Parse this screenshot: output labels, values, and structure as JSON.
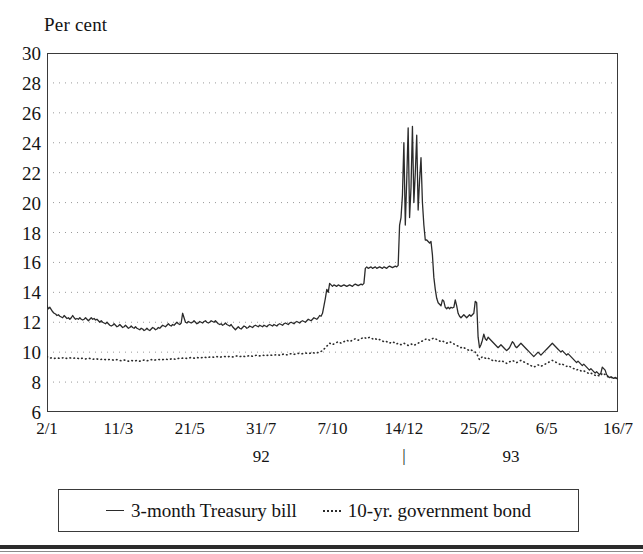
{
  "chart_data": {
    "type": "line",
    "title": "",
    "ylabel": "Per cent",
    "xlabel": "",
    "ylim": [
      6,
      30
    ],
    "ytick_values": [
      30,
      28,
      26,
      24,
      22,
      20,
      18,
      16,
      14,
      12,
      10,
      8,
      6
    ],
    "ytick_labels": [
      "30",
      "28",
      "26",
      "24",
      "22",
      "20",
      "18",
      "16",
      "14",
      "12",
      "10",
      "8",
      "6"
    ],
    "grid": true,
    "grid_style": "dotted-horizontal",
    "legend_position": "below-plot",
    "x_index_range": [
      0,
      400
    ],
    "xtick_positions": [
      0,
      50,
      100,
      150,
      200,
      250,
      300,
      350,
      400
    ],
    "xtick_labels": [
      "2/1",
      "11/3",
      "21/5",
      "31/7",
      "7/10",
      "14/12",
      "25/2",
      "6/5",
      "16/7"
    ],
    "year_labels": [
      {
        "label": "92",
        "x_index": 150
      },
      {
        "label": "93",
        "x_index": 325
      }
    ],
    "year_separator": {
      "label": "|",
      "x_index": 250
    },
    "series": [
      {
        "name": "3-month Treasury bill",
        "style": "solid",
        "color": "#2b2b2b",
        "values": [
          13.1,
          12.9,
          13.0,
          12.85,
          12.7,
          12.6,
          12.55,
          12.45,
          12.5,
          12.4,
          12.35,
          12.3,
          12.45,
          12.35,
          12.25,
          12.3,
          12.2,
          12.3,
          12.45,
          12.3,
          12.2,
          12.25,
          12.2,
          12.3,
          12.2,
          12.15,
          12.2,
          12.3,
          12.2,
          12.1,
          12.2,
          12.3,
          12.2,
          12.25,
          12.15,
          12.2,
          12.1,
          12.0,
          12.1,
          12.0,
          11.95,
          11.9,
          12.0,
          11.9,
          11.8,
          11.75,
          11.8,
          11.9,
          11.8,
          11.7,
          11.75,
          11.85,
          11.75,
          11.65,
          11.7,
          11.8,
          11.7,
          11.6,
          11.65,
          11.75,
          11.65,
          11.6,
          11.7,
          11.6,
          11.55,
          11.5,
          11.6,
          11.55,
          11.45,
          11.5,
          11.6,
          11.5,
          11.45,
          11.55,
          11.65,
          11.6,
          11.5,
          11.55,
          11.65,
          11.6,
          11.7,
          11.8,
          11.75,
          11.7,
          11.8,
          11.9,
          11.8,
          11.75,
          11.85,
          11.8,
          11.9,
          12.0,
          11.9,
          11.85,
          11.95,
          12.6,
          12.3,
          12.0,
          11.95,
          12.05,
          12.0,
          11.95,
          12.0,
          12.1,
          12.0,
          11.9,
          11.95,
          12.05,
          12.0,
          11.95,
          12.05,
          12.1,
          12.0,
          11.95,
          12.0,
          12.1,
          12.05,
          12.0,
          12.1,
          12.0,
          11.9,
          11.85,
          11.9,
          11.8,
          11.85,
          11.95,
          11.85,
          11.8,
          11.75,
          11.85,
          11.7,
          11.6,
          11.5,
          11.6,
          11.7,
          11.6,
          11.55,
          11.65,
          11.75,
          11.7,
          11.6,
          11.65,
          11.75,
          11.7,
          11.65,
          11.75,
          11.8,
          11.75,
          11.7,
          11.8,
          11.75,
          11.7,
          11.8,
          11.75,
          11.7,
          11.8,
          11.85,
          11.8,
          11.75,
          11.85,
          11.8,
          11.75,
          11.85,
          11.9,
          11.85,
          11.8,
          11.9,
          11.95,
          11.9,
          11.85,
          11.95,
          12.0,
          11.95,
          11.9,
          12.0,
          12.05,
          12.0,
          11.95,
          12.05,
          12.1,
          12.05,
          12.0,
          12.1,
          12.2,
          12.15,
          12.1,
          12.2,
          12.3,
          12.25,
          12.2,
          12.3,
          12.45,
          12.4,
          12.6,
          13.1,
          13.6,
          14.2,
          14.0,
          14.6,
          14.5,
          14.4,
          14.5,
          14.45,
          14.4,
          14.5,
          14.45,
          14.4,
          14.45,
          14.5,
          14.45,
          14.4,
          14.45,
          14.5,
          14.45,
          14.4,
          14.5,
          14.55,
          14.5,
          14.45,
          14.5,
          14.55,
          14.5,
          14.6,
          15.6,
          15.7,
          15.6,
          15.65,
          15.7,
          15.6,
          15.65,
          15.7,
          15.6,
          15.65,
          15.7,
          15.65,
          15.6,
          15.7,
          15.65,
          15.6,
          15.7,
          15.75,
          15.7,
          15.65,
          15.7,
          15.75,
          15.7,
          15.8,
          18.5,
          19.0,
          20.5,
          24.0,
          18.5,
          21.5,
          25.0,
          19.0,
          21.0,
          25.1,
          20.0,
          22.0,
          24.5,
          19.5,
          21.5,
          23.0,
          20.0,
          18.5,
          17.5,
          17.5,
          17.4,
          17.3,
          17.4,
          16.5,
          15.0,
          14.2,
          13.6,
          13.3,
          13.2,
          13.1,
          13.5,
          13.4,
          13.0,
          12.9,
          13.0,
          12.9,
          13.0,
          12.95,
          13.0,
          13.5,
          13.1,
          12.6,
          12.4,
          12.3,
          12.4,
          12.5,
          12.4,
          12.3,
          12.4,
          12.5,
          12.4,
          12.5,
          12.6,
          13.4,
          13.3,
          11.0,
          10.3,
          10.5,
          10.8,
          11.2,
          10.9,
          10.8,
          11.0,
          10.9,
          10.8,
          10.7,
          10.6,
          10.5,
          10.4,
          10.3,
          10.4,
          10.5,
          10.4,
          10.3,
          10.2,
          10.1,
          10.2,
          10.3,
          10.5,
          10.7,
          10.6,
          10.4,
          10.3,
          10.4,
          10.5,
          10.6,
          10.5,
          10.4,
          10.3,
          10.2,
          10.1,
          10.0,
          9.9,
          9.8,
          9.7,
          9.8,
          9.9,
          10.0,
          9.9,
          9.8,
          9.9,
          10.0,
          10.1,
          10.2,
          10.3,
          10.4,
          10.5,
          10.6,
          10.5,
          10.4,
          10.3,
          10.2,
          10.1,
          10.0,
          10.1,
          10.0,
          9.9,
          9.8,
          9.9,
          9.8,
          9.7,
          9.6,
          9.5,
          9.4,
          9.3,
          9.4,
          9.3,
          9.2,
          9.1,
          9.2,
          9.1,
          9.0,
          8.9,
          8.8,
          8.9,
          8.8,
          8.7,
          8.6,
          8.7,
          8.6,
          8.5,
          8.6,
          9.0,
          8.9,
          8.8,
          8.5,
          8.4,
          8.3,
          8.35,
          8.3,
          8.25,
          8.3,
          8.25,
          8.2
        ]
      },
      {
        "name": "10-yr. government bond",
        "style": "dotted",
        "color": "#2b2b2b",
        "values": [
          9.7,
          9.65,
          9.6,
          9.62,
          9.6,
          9.58,
          9.6,
          9.62,
          9.6,
          9.58,
          9.6,
          9.62,
          9.65,
          9.6,
          9.58,
          9.6,
          9.62,
          9.6,
          9.58,
          9.6,
          9.62,
          9.6,
          9.58,
          9.55,
          9.58,
          9.6,
          9.58,
          9.55,
          9.58,
          9.6,
          9.58,
          9.55,
          9.52,
          9.55,
          9.58,
          9.55,
          9.52,
          9.5,
          9.52,
          9.55,
          9.52,
          9.5,
          9.48,
          9.5,
          9.52,
          9.5,
          9.48,
          9.45,
          9.48,
          9.5,
          9.48,
          9.45,
          9.42,
          9.45,
          9.48,
          9.45,
          9.42,
          9.4,
          9.42,
          9.45,
          9.42,
          9.4,
          9.42,
          9.45,
          9.42,
          9.4,
          9.42,
          9.45,
          9.48,
          9.45,
          9.42,
          9.45,
          9.48,
          9.5,
          9.48,
          9.45,
          9.48,
          9.5,
          9.52,
          9.5,
          9.48,
          9.5,
          9.52,
          9.55,
          9.52,
          9.5,
          9.52,
          9.55,
          9.58,
          9.55,
          9.52,
          9.55,
          9.58,
          9.6,
          9.58,
          9.6,
          9.62,
          9.6,
          9.58,
          9.6,
          9.62,
          9.65,
          9.62,
          9.6,
          9.62,
          9.65,
          9.62,
          9.6,
          9.62,
          9.65,
          9.68,
          9.65,
          9.62,
          9.65,
          9.68,
          9.7,
          9.68,
          9.65,
          9.68,
          9.7,
          9.68,
          9.65,
          9.68,
          9.7,
          9.72,
          9.7,
          9.68,
          9.7,
          9.72,
          9.7,
          9.68,
          9.7,
          9.72,
          9.75,
          9.72,
          9.7,
          9.72,
          9.75,
          9.72,
          9.7,
          9.72,
          9.75,
          9.78,
          9.75,
          9.72,
          9.75,
          9.78,
          9.8,
          9.78,
          9.75,
          9.78,
          9.8,
          9.78,
          9.75,
          9.78,
          9.8,
          9.82,
          9.8,
          9.78,
          9.8,
          9.82,
          9.85,
          9.82,
          9.8,
          9.82,
          9.85,
          9.88,
          9.85,
          9.82,
          9.85,
          9.88,
          9.9,
          9.88,
          9.85,
          9.88,
          9.9,
          9.92,
          9.9,
          9.88,
          9.9,
          9.92,
          9.95,
          9.92,
          9.9,
          9.92,
          9.95,
          9.98,
          9.95,
          9.92,
          9.95,
          9.98,
          10.0,
          10.05,
          10.1,
          10.2,
          10.3,
          10.4,
          10.5,
          10.6,
          10.55,
          10.5,
          10.55,
          10.6,
          10.65,
          10.7,
          10.65,
          10.6,
          10.65,
          10.7,
          10.75,
          10.8,
          10.75,
          10.7,
          10.75,
          10.8,
          10.85,
          10.9,
          10.85,
          10.8,
          10.85,
          10.9,
          10.95,
          11.0,
          10.95,
          10.9,
          10.95,
          11.0,
          10.95,
          10.9,
          10.85,
          10.9,
          10.85,
          10.8,
          10.85,
          10.8,
          10.75,
          10.7,
          10.75,
          10.7,
          10.65,
          10.6,
          10.65,
          10.7,
          10.65,
          10.6,
          10.55,
          10.6,
          10.55,
          10.5,
          10.55,
          10.6,
          10.55,
          10.5,
          10.45,
          10.5,
          10.55,
          10.5,
          10.45,
          10.5,
          10.55,
          10.6,
          10.65,
          10.7,
          10.75,
          10.8,
          10.85,
          10.9,
          10.85,
          10.8,
          10.85,
          10.9,
          10.95,
          10.9,
          10.85,
          10.8,
          10.75,
          10.7,
          10.75,
          10.7,
          10.65,
          10.6,
          10.65,
          10.7,
          10.65,
          10.6,
          10.55,
          10.5,
          10.45,
          10.4,
          10.35,
          10.3,
          10.35,
          10.3,
          10.25,
          10.2,
          10.15,
          10.1,
          10.15,
          10.1,
          10.05,
          10.0,
          9.9,
          9.7,
          9.5,
          9.6,
          9.7,
          9.65,
          9.6,
          9.55,
          9.6,
          9.55,
          9.5,
          9.45,
          9.4,
          9.45,
          9.4,
          9.35,
          9.4,
          9.45,
          9.4,
          9.35,
          9.3,
          9.25,
          9.3,
          9.35,
          9.4,
          9.45,
          9.4,
          9.35,
          9.3,
          9.35,
          9.4,
          9.45,
          9.4,
          9.35,
          9.3,
          9.25,
          9.2,
          9.15,
          9.1,
          9.05,
          9.0,
          9.05,
          9.1,
          9.15,
          9.1,
          9.05,
          9.1,
          9.15,
          9.2,
          9.25,
          9.3,
          9.35,
          9.4,
          9.45,
          9.4,
          9.35,
          9.3,
          9.25,
          9.2,
          9.15,
          9.2,
          9.15,
          9.1,
          9.05,
          9.1,
          9.05,
          9.0,
          8.95,
          8.9,
          8.85,
          8.8,
          8.85,
          8.8,
          8.75,
          8.7,
          8.75,
          8.7,
          8.65,
          8.6,
          8.55,
          8.6,
          8.55,
          8.5,
          8.45,
          8.5,
          8.45,
          8.4,
          8.45,
          8.6,
          8.55,
          8.5,
          8.4,
          8.35,
          8.3,
          8.32,
          8.3,
          8.28,
          8.3,
          8.28,
          8.25
        ]
      }
    ]
  },
  "legend": {
    "items": [
      {
        "label": "3-month Treasury bill",
        "style": "solid"
      },
      {
        "label": "10-yr. government bond",
        "style": "dotted"
      }
    ]
  }
}
